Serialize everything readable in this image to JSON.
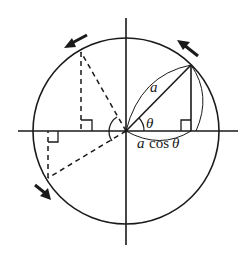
{
  "diagram": {
    "type": "circular-motion-projection",
    "stroke_color": "#1a1a1a",
    "background": "#ffffff",
    "center": [
      126,
      131
    ],
    "radius": 92,
    "labels": {
      "radius": "a",
      "angle": "θ",
      "projection_var": "a",
      "projection_func": "cos",
      "projection_angle": "θ"
    },
    "arrows": [
      {
        "name": "top-right-arrow",
        "direction": "counterclockwise"
      },
      {
        "name": "top-left-arrow",
        "direction": "counterclockwise"
      },
      {
        "name": "bottom-left-arrow",
        "direction": "counterclockwise"
      }
    ]
  }
}
